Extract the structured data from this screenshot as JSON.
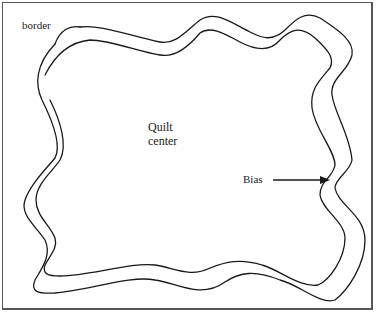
{
  "diagram": {
    "labels": {
      "border": "border",
      "center_line1": "Quilt",
      "center_line2": "center",
      "bias": "Bias"
    },
    "colors": {
      "line": "#1a1a1a",
      "frame": "#555555",
      "background": "#ffffff"
    },
    "annotations": [
      {
        "text": "Bias",
        "points_to": "right edge of border strip",
        "arrow": true
      }
    ]
  }
}
